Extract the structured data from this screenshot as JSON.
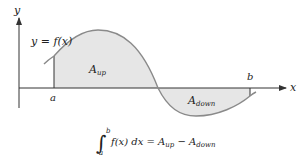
{
  "diagram": {
    "axes": {
      "x_label": "x",
      "y_label": "y"
    },
    "curve_label": "y = f(x)",
    "bounds": {
      "a_label": "a",
      "b_label": "b"
    },
    "regions": [
      {
        "name": "A",
        "sub": "up",
        "fill": "#e6e6e6"
      },
      {
        "name": "A",
        "sub": "down",
        "fill": "#e6e6e6"
      }
    ],
    "formula": {
      "upper": "b",
      "lower": "a",
      "integrand": "f(x) dx = A",
      "sub1": "up",
      "minus": " − A",
      "sub2": "down"
    },
    "colors": {
      "curve": "#8a8a8a",
      "axis": "#333333",
      "shade": "#e6e6e6"
    }
  }
}
